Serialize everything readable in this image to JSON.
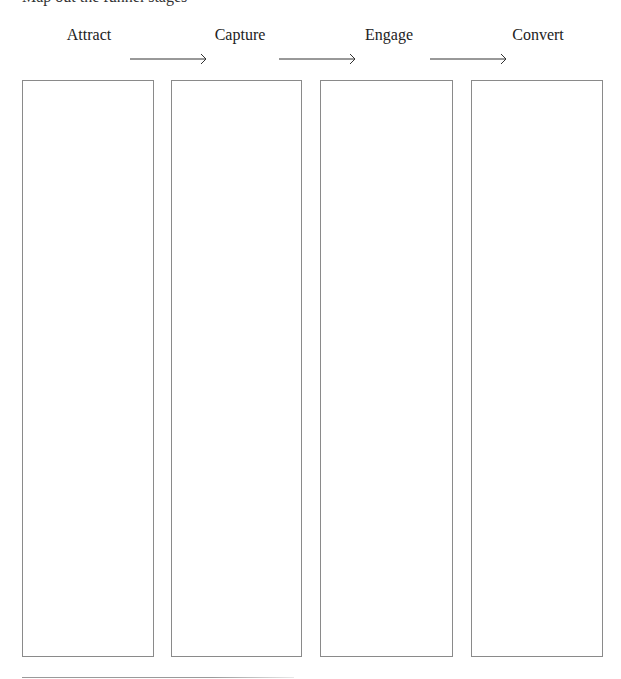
{
  "header": {
    "cut_off_text": "Map out the funnel stages"
  },
  "stages": [
    {
      "label": "Attract",
      "center_x": 89,
      "box_left": 22,
      "box_width": 132
    },
    {
      "label": "Capture",
      "center_x": 240,
      "box_left": 171,
      "box_width": 131
    },
    {
      "label": "Engage",
      "center_x": 389,
      "box_left": 320,
      "box_width": 133
    },
    {
      "label": "Convert",
      "center_x": 538,
      "box_left": 471,
      "box_width": 132
    }
  ],
  "arrows": [
    {
      "from": "Attract",
      "to": "Capture",
      "x1": 130,
      "x2": 206
    },
    {
      "from": "Capture",
      "to": "Engage",
      "x1": 279,
      "x2": 355
    },
    {
      "from": "Engage",
      "to": "Convert",
      "x1": 430,
      "x2": 506
    }
  ],
  "colors": {
    "box_border": "#8a8a8a",
    "arrow": "#333333",
    "text": "#222222"
  }
}
